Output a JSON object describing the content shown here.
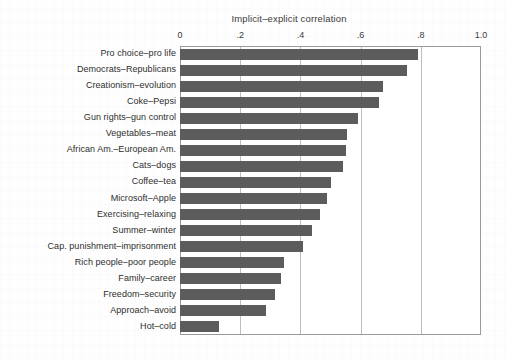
{
  "chart_data": {
    "type": "bar",
    "orientation": "horizontal",
    "title": "Implicit–explicit correlation",
    "xlabel": "",
    "ylabel": "",
    "xlim": [
      0,
      1.0
    ],
    "xticks": [
      "0",
      ".2",
      ".4",
      ".6",
      ".8",
      "1.0"
    ],
    "xtick_values": [
      0,
      0.2,
      0.4,
      0.6,
      0.8,
      1.0
    ],
    "grid": "vertical",
    "legend": "none",
    "bar_color": "#5c5c5c",
    "categories": [
      "Pro choice–pro life",
      "Democrats–Republicans",
      "Creationism–evolution",
      "Coke–Pepsi",
      "Gun rights–gun control",
      "Vegetables–meat",
      "African Am.–European Am.",
      "Cats–dogs",
      "Coffee–tea",
      "Microsoft–Apple",
      "Exercising–relaxing",
      "Summer–winter",
      "Cap. punishment–imprisonment",
      "Rich people–poor people",
      "Family–career",
      "Freedom–security",
      "Approach–avoid",
      "Hot–cold"
    ],
    "values": [
      0.79,
      0.755,
      0.675,
      0.66,
      0.59,
      0.555,
      0.55,
      0.54,
      0.5,
      0.49,
      0.465,
      0.44,
      0.41,
      0.345,
      0.335,
      0.315,
      0.285,
      0.13
    ]
  }
}
